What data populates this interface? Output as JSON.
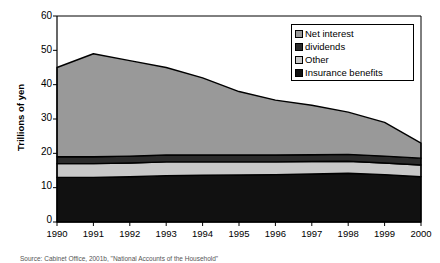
{
  "chart_data": {
    "type": "area",
    "stacked": true,
    "title": "",
    "xlabel": "",
    "ylabel": "Trillions of yen",
    "categories": [
      "1990",
      "1991",
      "1992",
      "1993",
      "1994",
      "1995",
      "1996",
      "1997",
      "1998",
      "1999",
      "2000"
    ],
    "x": [
      1990,
      1991,
      1992,
      1993,
      1994,
      1995,
      1996,
      1997,
      1998,
      1999,
      2000
    ],
    "ylim": [
      0,
      60
    ],
    "yticks": [
      0,
      10,
      20,
      30,
      40,
      50,
      60
    ],
    "grid": false,
    "legend_position": "top-right",
    "series": [
      {
        "name": "Insurance benefits",
        "color": "#111111",
        "values": [
          13.0,
          13.0,
          13.2,
          13.5,
          13.6,
          13.7,
          13.8,
          14.0,
          14.2,
          13.8,
          13.2
        ]
      },
      {
        "name": "Other",
        "color": "#c8c8c8",
        "values": [
          4.0,
          4.0,
          4.0,
          4.0,
          3.9,
          3.8,
          3.7,
          3.6,
          3.5,
          3.4,
          3.4
        ]
      },
      {
        "name": "dividends",
        "color": "#2b2b2b",
        "values": [
          2.0,
          2.0,
          2.0,
          2.0,
          2.0,
          2.0,
          2.0,
          2.0,
          2.0,
          2.0,
          2.0
        ]
      },
      {
        "name": "Net interest",
        "color": "#999999",
        "values": [
          26.0,
          30.0,
          27.8,
          25.5,
          22.5,
          18.5,
          16.0,
          14.4,
          12.3,
          9.8,
          4.4
        ]
      }
    ],
    "cumulative_tops": {
      "insurance_benefits": [
        13.0,
        13.0,
        13.2,
        13.5,
        13.6,
        13.7,
        13.8,
        14.0,
        14.2,
        13.8,
        13.2
      ],
      "other": [
        17.0,
        17.0,
        17.2,
        17.5,
        17.5,
        17.5,
        17.5,
        17.6,
        17.7,
        17.2,
        16.6
      ],
      "dividends": [
        19.0,
        19.0,
        19.2,
        19.5,
        19.5,
        19.5,
        19.5,
        19.6,
        19.7,
        19.2,
        18.6
      ],
      "net_interest_total": [
        45.0,
        49.0,
        47.0,
        45.0,
        42.0,
        38.0,
        35.5,
        34.0,
        32.0,
        29.0,
        23.0
      ]
    },
    "legend": [
      {
        "label": "Net interest",
        "swatch_name": "legend-swatch-net-interest",
        "color": "#999999"
      },
      {
        "label": "dividends",
        "swatch_name": "legend-swatch-dividends",
        "color": "#2b2b2b"
      },
      {
        "label": "Other",
        "swatch_name": "legend-swatch-other",
        "color": "#c8c8c8"
      },
      {
        "label": "Insurance benefits",
        "swatch_name": "legend-swatch-insurance-benefits",
        "color": "#111111"
      }
    ]
  },
  "axes": {
    "y_title": "Trillions of yen",
    "y_tick_labels": [
      "60",
      "50",
      "40",
      "30",
      "20",
      "10",
      "0"
    ],
    "x_tick_labels": [
      "1990",
      "1991",
      "1992",
      "1993",
      "1994",
      "1995",
      "1996",
      "1997",
      "1998",
      "1999",
      "2000"
    ]
  },
  "caption": {
    "text": "Source: Cabinet Office, 2001b, \"National Accounts of the Household\""
  }
}
